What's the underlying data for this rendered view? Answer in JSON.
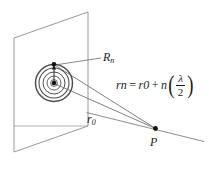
{
  "figure": {
    "type": "physics-optics-diagram",
    "title_text": "Newton's rings / zone plate geometry diagram",
    "background_color": "#ffffff",
    "line_color": "#555555",
    "ink_color": "#1a1a1a",
    "ring_color": "#4a4a4a",
    "labels": {
      "outer_radius": "R",
      "outer_radius_sub": "n",
      "base_distance": "r",
      "base_distance_sub": "0",
      "point": "P"
    },
    "equation": {
      "lhs_var": "r",
      "lhs_sub": "n",
      "equals": "=",
      "rhs_var": "r",
      "rhs_sub": "0",
      "plus": "+",
      "coef": "n",
      "paren_open": "(",
      "numerator": "λ",
      "denominator": "2",
      "paren_close": ")",
      "full_text": "r_n = r_0 + n(λ/2)"
    },
    "caption": "",
    "geometry": {
      "plane_corners": "parallelogram screen plane",
      "ring_count": 4,
      "center_dot": "source point on plane",
      "edge_dot": "zone edge point",
      "rays": 2,
      "axis_line": "ray through P extending right"
    }
  }
}
